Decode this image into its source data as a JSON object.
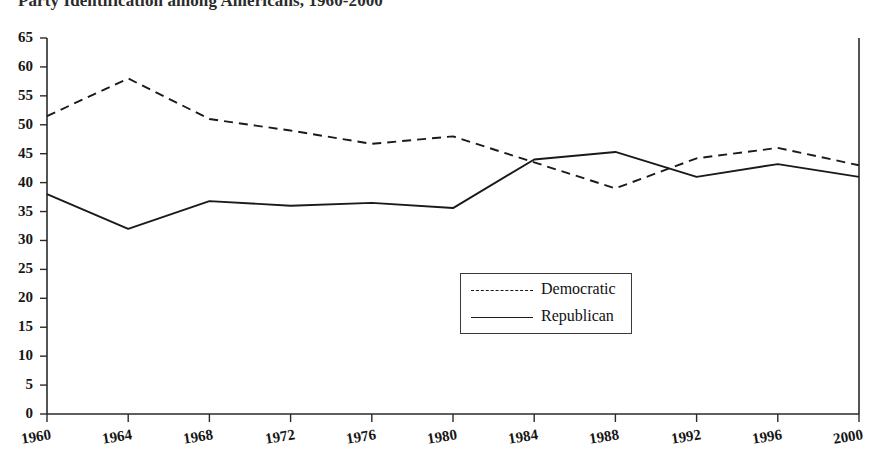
{
  "chart_data": {
    "type": "line",
    "title": "Party Identification among Americans, 1960-2000",
    "xlabel": "",
    "ylabel": "",
    "x": [
      1960,
      1964,
      1968,
      1972,
      1976,
      1980,
      1984,
      1988,
      1992,
      1996,
      2000
    ],
    "categories": [
      "1960",
      "1964",
      "1968",
      "1972",
      "1976",
      "1980",
      "1984",
      "1988",
      "1992",
      "1996",
      "2000"
    ],
    "xlim": [
      1960,
      2000
    ],
    "ylim": [
      0,
      65
    ],
    "ytick_labels": [
      "0",
      "5",
      "10",
      "15",
      "20",
      "25",
      "30",
      "35",
      "40",
      "45",
      "50",
      "55",
      "60",
      "65"
    ],
    "yticks": [
      0,
      5,
      10,
      15,
      20,
      25,
      30,
      35,
      40,
      45,
      50,
      55,
      60,
      65
    ],
    "grid": false,
    "legend_position": "center-right",
    "series": [
      {
        "name": "Democratic",
        "style": "dashed",
        "color": "#1a1a1a",
        "values": [
          51.5,
          58.0,
          51.0,
          49.0,
          46.7,
          48.0,
          43.5,
          39.0,
          44.2,
          46.0,
          43.0
        ]
      },
      {
        "name": "Republican",
        "style": "solid",
        "color": "#1a1a1a",
        "values": [
          38.0,
          32.0,
          36.8,
          36.0,
          36.5,
          35.6,
          44.0,
          45.3,
          41.0,
          43.2,
          41.0
        ]
      }
    ]
  },
  "legend": {
    "entries": [
      {
        "label": "Democratic"
      },
      {
        "label": "Republican"
      }
    ]
  }
}
